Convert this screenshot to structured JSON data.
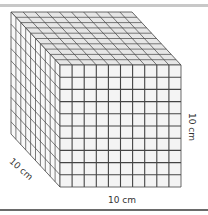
{
  "figure": {
    "type": "cube-grid-diagram",
    "grid_divisions": 10,
    "labels": {
      "width": "10 cm",
      "height": "10 cm",
      "depth": "10 cm"
    },
    "colors": {
      "grid_line": "#444444",
      "face_fill": "#f4f4f4",
      "top_fill": "#e6e6e6",
      "side_fill": "#f8f8f8",
      "top_border": "#c8c8c8",
      "bottom_border": "#6a6a6a"
    }
  }
}
